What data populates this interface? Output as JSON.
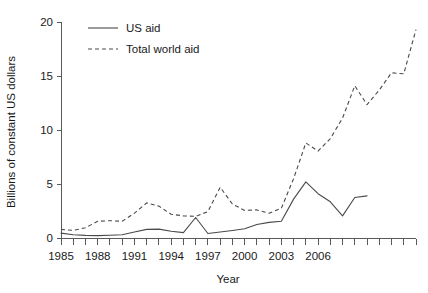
{
  "chart_data": {
    "type": "line",
    "title": "",
    "xlabel": "Year",
    "ylabel": "Billions of constant US dollars",
    "xlim": [
      1985,
      2008
    ],
    "ylim": [
      0,
      20
    ],
    "grid": false,
    "legend_position": "top-left",
    "x": [
      1985,
      1986,
      1987,
      1988,
      1989,
      1990,
      1991,
      1992,
      1993,
      1994,
      1995,
      1996,
      1997,
      1998,
      1999,
      2000,
      2001,
      2002,
      2003,
      2004,
      2005,
      2006,
      2007,
      2008
    ],
    "xticks_major": [
      1985,
      1988,
      1991,
      1994,
      1997,
      2000,
      2003,
      2006
    ],
    "xtick_labels": [
      "1985",
      "1988",
      "1991",
      "1994",
      "1997",
      "2000",
      "2003",
      "2006"
    ],
    "yticks": [
      0,
      5,
      10,
      15,
      20
    ],
    "ytick_labels": [
      "0",
      "5",
      "10",
      "15",
      "20"
    ],
    "series": [
      {
        "name": "US aid",
        "style": "solid",
        "color": "#4a4a4a",
        "values": [
          0.45,
          0.32,
          0.25,
          0.22,
          0.25,
          0.28,
          0.3,
          0.3,
          0.45,
          0.7,
          0.85,
          0.75,
          1.9,
          0.55,
          0.45,
          0.5,
          0.62,
          0.8,
          1.05,
          1.3,
          1.45,
          1.5,
          1.6,
          1.7
        ]
      },
      {
        "name": "Total world aid",
        "style": "dashed",
        "color": "#4a4a4a",
        "values": [
          0.8,
          0.75,
          0.95,
          1.55,
          1.7,
          1.6,
          2.55,
          3.3,
          2.95,
          2.25,
          2.1,
          2.05,
          2.2,
          4.7,
          3.15,
          2.6,
          2.65,
          2.35,
          2.8,
          3.35,
          5.05,
          6.05,
          7.05,
          8.05
        ]
      }
    ],
    "series_points": {
      "US aid": [
        [
          1985,
          0.45
        ],
        [
          1986,
          0.3
        ],
        [
          1987,
          0.24
        ],
        [
          1988,
          0.22
        ],
        [
          1989,
          0.26
        ],
        [
          1990,
          0.3
        ],
        [
          1991,
          0.55
        ],
        [
          1992,
          0.8
        ],
        [
          1993,
          0.82
        ],
        [
          1994,
          0.62
        ],
        [
          1995,
          0.5
        ],
        [
          1996,
          1.9
        ],
        [
          1997,
          0.42
        ],
        [
          1998,
          0.55
        ],
        [
          1999,
          0.7
        ],
        [
          2000,
          0.85
        ],
        [
          2001,
          1.25
        ],
        [
          2002,
          1.45
        ],
        [
          2003,
          1.55
        ],
        [
          2004,
          3.6
        ],
        [
          2005,
          5.2
        ],
        [
          2006,
          4.1
        ],
        [
          2007,
          3.35
        ],
        [
          2008,
          2.05
        ],
        [
          2009,
          3.75
        ],
        [
          2010,
          3.9
        ]
      ],
      "Total world aid": [
        [
          1985,
          0.8
        ],
        [
          1986,
          0.7
        ],
        [
          1987,
          0.95
        ],
        [
          1988,
          1.55
        ],
        [
          1989,
          1.6
        ],
        [
          1990,
          1.55
        ],
        [
          1991,
          2.3
        ],
        [
          1992,
          3.25
        ],
        [
          1993,
          2.95
        ],
        [
          1994,
          2.2
        ],
        [
          1995,
          2.05
        ],
        [
          1996,
          2.0
        ],
        [
          1997,
          2.45
        ],
        [
          1998,
          4.7
        ],
        [
          1999,
          3.15
        ],
        [
          2000,
          2.55
        ],
        [
          2001,
          2.6
        ],
        [
          2002,
          2.3
        ],
        [
          2003,
          2.75
        ],
        [
          2004,
          5.5
        ],
        [
          2005,
          8.8
        ],
        [
          2006,
          8.05
        ],
        [
          2007,
          9.2
        ],
        [
          2008,
          11.1
        ],
        [
          2009,
          14.1
        ],
        [
          2010,
          12.35
        ],
        [
          2011,
          13.7
        ],
        [
          2012,
          15.3
        ],
        [
          2013,
          15.2
        ],
        [
          2014,
          19.3
        ]
      ]
    },
    "annotations": []
  },
  "legend": {
    "items": [
      {
        "label": "US aid",
        "style": "solid"
      },
      {
        "label": "Total world aid",
        "style": "dashed"
      }
    ]
  },
  "axes": {
    "y_title": "Billions of constant US dollars",
    "x_title": "Year"
  }
}
